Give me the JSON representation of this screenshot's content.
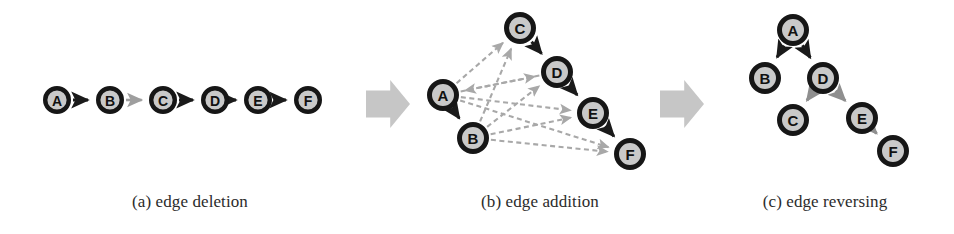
{
  "figure": {
    "background": "#ffffff",
    "width": 954,
    "height": 234,
    "colors": {
      "node_ring": "#161616",
      "node_fill": "#c9c9c9",
      "node_label": "#111111",
      "edge_active": "#1a1a1a",
      "edge_inactive": "#9e9e9e",
      "edge_added": "#a8a8a8",
      "edge_reversed": "#8f8f8f",
      "block_arrow": "#c6c6c6",
      "caption_text": "#2b2b2b"
    }
  },
  "panels": [
    {
      "id": "a",
      "caption": "(a) edge deletion",
      "nodes": [
        {
          "id": "A",
          "label": "A",
          "x": 57,
          "y": 100,
          "r": 14
        },
        {
          "id": "B",
          "label": "B",
          "x": 110,
          "y": 100,
          "r": 14
        },
        {
          "id": "C",
          "label": "C",
          "x": 163,
          "y": 100,
          "r": 14
        },
        {
          "id": "D",
          "label": "D",
          "x": 215,
          "y": 100,
          "r": 14
        },
        {
          "id": "E",
          "label": "E",
          "x": 258,
          "y": 100,
          "r": 14
        },
        {
          "id": "F",
          "label": "F",
          "x": 308,
          "y": 100,
          "r": 14
        }
      ],
      "edges": [
        {
          "from": "A",
          "to": "B",
          "style": "solid",
          "state": "kept"
        },
        {
          "from": "B",
          "to": "C",
          "style": "solid",
          "state": "deleted"
        },
        {
          "from": "C",
          "to": "D",
          "style": "solid",
          "state": "kept"
        },
        {
          "from": "D",
          "to": "E",
          "style": "solid",
          "state": "kept"
        },
        {
          "from": "E",
          "to": "F",
          "style": "solid",
          "state": "kept"
        }
      ]
    },
    {
      "id": "b",
      "caption": "(b) edge addition",
      "nodes": [
        {
          "id": "A",
          "label": "A",
          "x": 443,
          "y": 95,
          "r": 16
        },
        {
          "id": "B",
          "label": "B",
          "x": 473,
          "y": 138,
          "r": 16
        },
        {
          "id": "C",
          "label": "C",
          "x": 520,
          "y": 28,
          "r": 16
        },
        {
          "id": "D",
          "label": "D",
          "x": 557,
          "y": 72,
          "r": 16
        },
        {
          "id": "E",
          "label": "E",
          "x": 593,
          "y": 113,
          "r": 16
        },
        {
          "id": "F",
          "label": "F",
          "x": 630,
          "y": 154,
          "r": 16
        }
      ],
      "edges": [
        {
          "from": "A",
          "to": "B",
          "style": "solid",
          "state": "kept"
        },
        {
          "from": "C",
          "to": "D",
          "style": "solid",
          "state": "kept"
        },
        {
          "from": "D",
          "to": "E",
          "style": "solid",
          "state": "kept"
        },
        {
          "from": "E",
          "to": "F",
          "style": "solid",
          "state": "kept"
        },
        {
          "from": "A",
          "to": "C",
          "style": "dashed",
          "state": "added"
        },
        {
          "from": "A",
          "to": "D",
          "style": "dashed",
          "state": "added"
        },
        {
          "from": "A",
          "to": "E",
          "style": "dashed",
          "state": "added"
        },
        {
          "from": "A",
          "to": "F",
          "style": "dashed",
          "state": "added"
        },
        {
          "from": "B",
          "to": "C",
          "style": "dashed",
          "state": "added"
        },
        {
          "from": "B",
          "to": "D",
          "style": "dashed",
          "state": "added"
        },
        {
          "from": "B",
          "to": "E",
          "style": "dashed",
          "state": "added"
        },
        {
          "from": "B",
          "to": "F",
          "style": "dashed",
          "state": "added"
        },
        {
          "from": "D",
          "to": "A",
          "style": "dashed",
          "state": "added"
        }
      ]
    },
    {
      "id": "c",
      "caption": "(c) edge reversing",
      "nodes": [
        {
          "id": "A",
          "label": "A",
          "x": 793,
          "y": 30,
          "r": 16
        },
        {
          "id": "B",
          "label": "B",
          "x": 765,
          "y": 78,
          "r": 16
        },
        {
          "id": "D",
          "label": "D",
          "x": 823,
          "y": 78,
          "r": 16
        },
        {
          "id": "C",
          "label": "C",
          "x": 793,
          "y": 120,
          "r": 16
        },
        {
          "id": "E",
          "label": "E",
          "x": 862,
          "y": 118,
          "r": 16
        },
        {
          "id": "F",
          "label": "F",
          "x": 893,
          "y": 151,
          "r": 16
        }
      ],
      "edges": [
        {
          "from": "A",
          "to": "B",
          "style": "solid",
          "state": "kept"
        },
        {
          "from": "A",
          "to": "D",
          "style": "solid",
          "state": "kept"
        },
        {
          "from": "D",
          "to": "C",
          "style": "solid",
          "state": "reversed"
        },
        {
          "from": "D",
          "to": "E",
          "style": "solid",
          "state": "reversed"
        },
        {
          "from": "E",
          "to": "F",
          "style": "solid",
          "state": "reversed"
        }
      ]
    }
  ],
  "block_arrows": [
    {
      "id": "transition-a-to-b",
      "x": 366,
      "y": 80,
      "width": 44,
      "height": 48
    },
    {
      "id": "transition-b-to-c",
      "x": 660,
      "y": 80,
      "width": 44,
      "height": 48
    }
  ]
}
